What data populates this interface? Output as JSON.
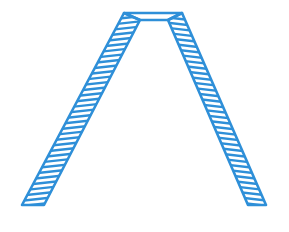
{
  "figure": {
    "stroke_color": "#2e8fd8",
    "background": "#ffffff",
    "hatch_count_left": 36,
    "hatch_count_right": 36
  }
}
